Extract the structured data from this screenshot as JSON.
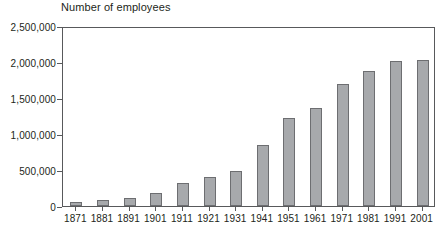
{
  "chart_data": {
    "type": "bar",
    "title": "Number of employees",
    "xlabel": "",
    "ylabel": "",
    "grid": false,
    "legend": false,
    "ylim": [
      0,
      2500000
    ],
    "ytick_labels": [
      "2,500,000",
      "2,000,000",
      "1,500,000",
      "1,000,000",
      "500,000",
      "0"
    ],
    "ytick_values": [
      2500000,
      2000000,
      1500000,
      1000000,
      500000,
      0
    ],
    "categories": [
      "1871",
      "1881",
      "1891",
      "1901",
      "1911",
      "1921",
      "1931",
      "1941",
      "1951",
      "1961",
      "1971",
      "1981",
      "1991",
      "2001"
    ],
    "values": [
      54000,
      81000,
      116000,
      184000,
      320000,
      403000,
      483000,
      847000,
      1220000,
      1360000,
      1700000,
      1870000,
      2010000,
      2030000
    ],
    "bar_color": "#a7a9ac",
    "bar_border_color": "#6d6e71",
    "axis_color": "#58595b",
    "text_color": "#231f20"
  }
}
